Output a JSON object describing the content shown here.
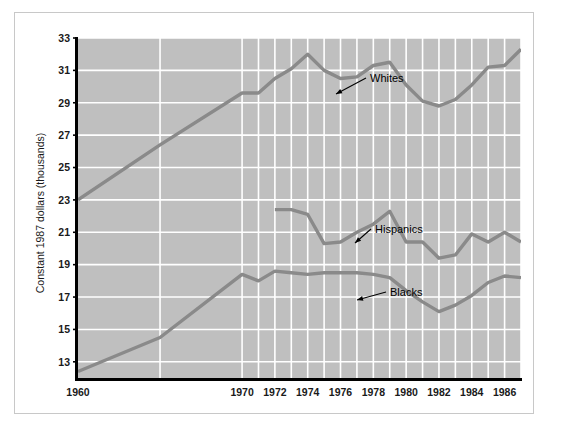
{
  "figure": {
    "background_color": "#ffffff",
    "frame_color": "#c8c8c8",
    "plot_background_color": "#bfbfbf",
    "grid_color": "#ffffff",
    "axis_color": "#000000",
    "line_color": "#8a8a8a"
  },
  "chart_data": {
    "type": "line",
    "title": "",
    "xlabel": "",
    "ylabel": "Constant 1987 dollars (thousands)",
    "xlim": [
      1960,
      1987
    ],
    "ylim": [
      12,
      33
    ],
    "yticks": [
      13,
      15,
      17,
      19,
      21,
      23,
      25,
      27,
      29,
      31,
      33
    ],
    "xticks": [
      1960,
      1970,
      1972,
      1974,
      1976,
      1978,
      1980,
      1982,
      1984,
      1986
    ],
    "xtick_labels": [
      "1960",
      "1970",
      "1972",
      "1974",
      "1976",
      "1978",
      "1980",
      "1982",
      "1984",
      "1986"
    ],
    "ytick_labels": [
      "13",
      "15",
      "17",
      "19",
      "21",
      "23",
      "25",
      "27",
      "29",
      "31",
      "33"
    ],
    "grid": true,
    "legend_position": "inline-annotations",
    "series": [
      {
        "name": "Whites",
        "label": "Whites",
        "x": [
          1960,
          1965,
          1970,
          1971,
          1972,
          1973,
          1974,
          1975,
          1976,
          1977,
          1978,
          1979,
          1980,
          1981,
          1982,
          1983,
          1984,
          1985,
          1986,
          1987
        ],
        "values": [
          23.0,
          26.4,
          29.6,
          29.6,
          30.5,
          31.1,
          32.0,
          31.0,
          30.5,
          30.6,
          31.3,
          31.5,
          30.1,
          29.1,
          28.8,
          29.2,
          30.1,
          31.2,
          31.3,
          32.3
        ]
      },
      {
        "name": "Hispanics",
        "label": "Hispanics",
        "x": [
          1972,
          1973,
          1974,
          1975,
          1976,
          1977,
          1978,
          1979,
          1980,
          1981,
          1982,
          1983,
          1984,
          1985,
          1986,
          1987
        ],
        "values": [
          22.4,
          22.4,
          22.1,
          20.3,
          20.4,
          21.0,
          21.5,
          22.3,
          20.4,
          20.4,
          19.4,
          19.6,
          20.9,
          20.4,
          21.0,
          20.4
        ]
      },
      {
        "name": "Blacks",
        "label": "Blacks",
        "x": [
          1960,
          1965,
          1970,
          1971,
          1972,
          1973,
          1974,
          1975,
          1976,
          1977,
          1978,
          1979,
          1980,
          1981,
          1982,
          1983,
          1984,
          1985,
          1986,
          1987
        ],
        "values": [
          12.4,
          14.5,
          18.4,
          18.0,
          18.6,
          18.5,
          18.4,
          18.5,
          18.5,
          18.5,
          18.4,
          18.2,
          17.4,
          16.7,
          16.1,
          16.5,
          17.1,
          17.9,
          18.3,
          18.2
        ]
      }
    ],
    "annotations": [
      {
        "name": "Whites",
        "text": "Whites",
        "label_x": 370,
        "label_y": 78,
        "point_x": 336,
        "point_y": 94
      },
      {
        "name": "Hispanics",
        "text": "Hispanics",
        "label_x": 375,
        "label_y": 229,
        "point_x": 355,
        "point_y": 243
      },
      {
        "name": "Blacks",
        "text": "Blacks",
        "label_x": 390,
        "label_y": 292,
        "point_x": 357,
        "point_y": 300
      }
    ]
  }
}
